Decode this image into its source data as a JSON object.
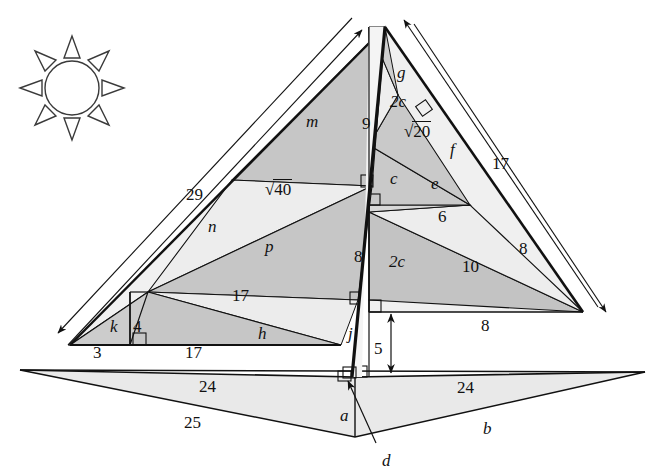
{
  "figure": {
    "icons": [
      {
        "name": "sun-icon",
        "cx": 72,
        "cy": 88,
        "r": 27,
        "rays": 8
      }
    ],
    "colors": {
      "stroke": "#111111",
      "fill_light": "#efefef",
      "fill_mid": "#e0e0e0",
      "fill_dark": "#bdbdbd",
      "fill_base": "#e8e8e8",
      "background": "#ffffff"
    },
    "vertices": {
      "apex": [
        385,
        27
      ],
      "left_corner": [
        70,
        345
      ],
      "right_corner": [
        583,
        312
      ],
      "base_left_tip": [
        20,
        370
      ],
      "base_right_tip": [
        645,
        372
      ],
      "base_bottom": [
        355,
        437
      ],
      "base_center_top": [
        355,
        377
      ]
    },
    "dimension_arrows": [
      {
        "name": "arrow-29",
        "label": "29",
        "x1": 58,
        "y1": 333,
        "x2": 352,
        "y2": 18
      },
      {
        "name": "arrow-17-right",
        "label": "17",
        "x1": 404,
        "y1": 20,
        "x2": 598,
        "y2": 307
      },
      {
        "name": "arrow-5",
        "label": "5",
        "x1": 391,
        "y1": 313,
        "x2": 391,
        "y2": 372
      },
      {
        "name": "arrow-d",
        "label": "d",
        "x1": 372,
        "y1": 438,
        "x2": 347,
        "y2": 382
      }
    ],
    "labels": [
      {
        "name": "label-m",
        "text": "m",
        "kind": "var",
        "x": 306,
        "y": 113
      },
      {
        "name": "label-9",
        "text": "9",
        "kind": "num",
        "x": 362,
        "y": 115
      },
      {
        "name": "label-g",
        "text": "g",
        "kind": "var",
        "x": 397,
        "y": 64
      },
      {
        "name": "label-2c-top",
        "text": "2c",
        "kind": "var",
        "x": 390,
        "y": 93
      },
      {
        "name": "label-sqrt20",
        "text": "20",
        "kind": "rad",
        "x": 404,
        "y": 123
      },
      {
        "name": "label-f",
        "text": "f",
        "kind": "var",
        "x": 450,
        "y": 141
      },
      {
        "name": "label-17-right",
        "text": "17",
        "kind": "num",
        "x": 492,
        "y": 155
      },
      {
        "name": "label-c",
        "text": "c",
        "kind": "var",
        "x": 390,
        "y": 170
      },
      {
        "name": "label-e",
        "text": "e",
        "kind": "var",
        "x": 431,
        "y": 175
      },
      {
        "name": "label-sqrt40",
        "text": "40",
        "kind": "rad",
        "x": 265,
        "y": 181
      },
      {
        "name": "label-29",
        "text": "29",
        "kind": "num",
        "x": 186,
        "y": 186
      },
      {
        "name": "label-n",
        "text": "n",
        "kind": "var",
        "x": 208,
        "y": 218
      },
      {
        "name": "label-6",
        "text": "6",
        "kind": "num",
        "x": 438,
        "y": 208
      },
      {
        "name": "label-p",
        "text": "p",
        "kind": "var",
        "x": 265,
        "y": 238
      },
      {
        "name": "label-8-left",
        "text": "8",
        "kind": "num",
        "x": 354,
        "y": 248
      },
      {
        "name": "label-2c-mid",
        "text": "2c",
        "kind": "var",
        "x": 389,
        "y": 253
      },
      {
        "name": "label-10",
        "text": "10",
        "kind": "num",
        "x": 462,
        "y": 258
      },
      {
        "name": "label-8-right",
        "text": "8",
        "kind": "num",
        "x": 519,
        "y": 240
      },
      {
        "name": "label-17-mid",
        "text": "17",
        "kind": "num",
        "x": 232,
        "y": 287
      },
      {
        "name": "label-8-bottom",
        "text": "8",
        "kind": "num",
        "x": 481,
        "y": 317
      },
      {
        "name": "label-h",
        "text": "h",
        "kind": "var",
        "x": 258,
        "y": 325
      },
      {
        "name": "label-j",
        "text": "j",
        "kind": "var",
        "x": 348,
        "y": 325
      },
      {
        "name": "label-k",
        "text": "k",
        "kind": "var",
        "x": 110,
        "y": 318
      },
      {
        "name": "label-4",
        "text": "4",
        "kind": "num",
        "x": 133,
        "y": 318
      },
      {
        "name": "label-3",
        "text": "3",
        "kind": "num",
        "x": 93,
        "y": 344
      },
      {
        "name": "label-17-low",
        "text": "17",
        "kind": "num",
        "x": 185,
        "y": 344
      },
      {
        "name": "label-5",
        "text": "5",
        "kind": "num",
        "x": 374,
        "y": 340
      },
      {
        "name": "label-24-left",
        "text": "24",
        "kind": "num",
        "x": 199,
        "y": 378
      },
      {
        "name": "label-24-right",
        "text": "24",
        "kind": "num",
        "x": 457,
        "y": 379
      },
      {
        "name": "label-25",
        "text": "25",
        "kind": "num",
        "x": 184,
        "y": 414
      },
      {
        "name": "label-a",
        "text": "a",
        "kind": "var",
        "x": 340,
        "y": 407
      },
      {
        "name": "label-b",
        "text": "b",
        "kind": "var",
        "x": 483,
        "y": 420
      },
      {
        "name": "label-d",
        "text": "d",
        "kind": "var",
        "x": 382,
        "y": 452
      }
    ],
    "measurements": {
      "slant_left": "29",
      "slant_right": "17",
      "height_upper": "9",
      "height_lower": "8",
      "base_left_half": "24",
      "base_right_half": "24",
      "base_edge": "25",
      "right_base_run": "8",
      "right_hyp_mid": "10",
      "right_upper_run": "6",
      "right_upper_hyp": "8",
      "left_small_base": "3",
      "left_small_height": "4",
      "left_mid_run": "17",
      "left_low_run": "17",
      "vertical_offset": "5",
      "radical_20": "√20",
      "radical_40": "√40"
    },
    "unknowns": [
      "a",
      "b",
      "c",
      "2c",
      "d",
      "e",
      "f",
      "g",
      "h",
      "j",
      "k",
      "m",
      "n",
      "p"
    ]
  }
}
